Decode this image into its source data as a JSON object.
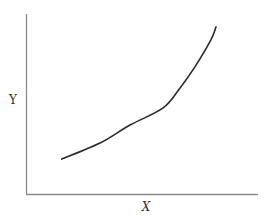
{
  "chart_data": {
    "type": "line",
    "title": "",
    "xlabel": "X",
    "ylabel": "Y",
    "xlim": [
      0,
      1
    ],
    "ylim": [
      0,
      1
    ],
    "grid": false,
    "legend": null,
    "x_ticks": [],
    "y_ticks": [],
    "series": [
      {
        "name": "curve",
        "color": "#2b2b2b",
        "x": [
          0.154,
          0.319,
          0.448,
          0.591,
          0.664,
          0.728,
          0.797,
          0.819
        ],
        "y": [
          0.194,
          0.283,
          0.383,
          0.478,
          0.589,
          0.706,
          0.856,
          0.929
        ]
      }
    ],
    "annotations": []
  },
  "layout": {
    "origin_px": [
      26,
      194
    ],
    "x_axis_end_px": 258,
    "y_axis_top_px": 14,
    "axis_color": "#8a8a8a",
    "background": "#ffffff"
  }
}
